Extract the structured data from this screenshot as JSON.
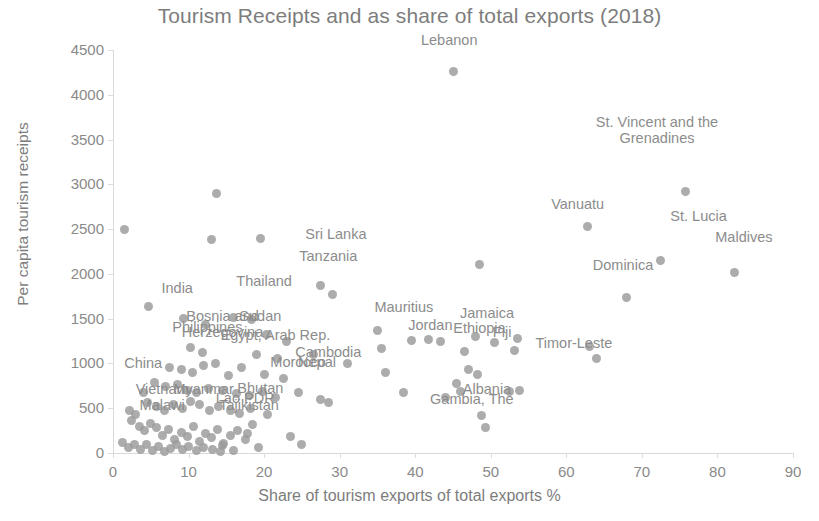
{
  "chart_data": {
    "type": "scatter",
    "title": "Tourism Receipts and as share of total exports (2018)",
    "xlabel": "Share of tourism exports of total exports %",
    "ylabel": "Per capita tourism receipts",
    "xlim": [
      0,
      90
    ],
    "ylim": [
      0,
      4500
    ],
    "xticks": [
      0,
      10,
      20,
      30,
      40,
      50,
      60,
      70,
      80,
      90
    ],
    "yticks": [
      0,
      500,
      1000,
      1500,
      2000,
      2500,
      3000,
      3500,
      4000,
      4500
    ],
    "grid": false,
    "legend": "none",
    "point_color": "#9a9a9a",
    "label_color": "#8c8c8c",
    "annotations": [
      {
        "text": "Lebanon",
        "x": 44.5,
        "y": 4600
      },
      {
        "text": "St. Vincent and the\nGrenadines",
        "x": 72.0,
        "y": 3700
      },
      {
        "text": "Vanuatu",
        "x": 61.5,
        "y": 2770
      },
      {
        "text": "St. Lucia",
        "x": 77.5,
        "y": 2640
      },
      {
        "text": "Maldives",
        "x": 83.5,
        "y": 2400
      },
      {
        "text": "Sri Lanka",
        "x": 29.5,
        "y": 2430
      },
      {
        "text": "Tanzania",
        "x": 28.5,
        "y": 2190
      },
      {
        "text": "Dominica",
        "x": 67.5,
        "y": 2090
      },
      {
        "text": "Thailand",
        "x": 20.0,
        "y": 1910
      },
      {
        "text": "India",
        "x": 8.5,
        "y": 1830
      },
      {
        "text": "Mauritius",
        "x": 38.5,
        "y": 1620
      },
      {
        "text": "Jamaica",
        "x": 49.5,
        "y": 1555
      },
      {
        "text": "Bosnia and\nHerzegovina",
        "x": 14.5,
        "y": 1530
      },
      {
        "text": "Sudan",
        "x": 19.5,
        "y": 1520
      },
      {
        "text": "Jordan",
        "x": 42.0,
        "y": 1420
      },
      {
        "text": "Philippines",
        "x": 12.5,
        "y": 1400
      },
      {
        "text": "Ethiopia",
        "x": 48.5,
        "y": 1380
      },
      {
        "text": "Fiji",
        "x": 51.5,
        "y": 1345
      },
      {
        "text": "Egypt, Arab Rep.",
        "x": 21.5,
        "y": 1310
      },
      {
        "text": "Timor-Leste",
        "x": 61.0,
        "y": 1215
      },
      {
        "text": "Cambodia",
        "x": 28.5,
        "y": 1120
      },
      {
        "text": "Morocco",
        "x": 24.5,
        "y": 1010
      },
      {
        "text": "China",
        "x": 4.0,
        "y": 990
      },
      {
        "text": "Nepal",
        "x": 27.0,
        "y": 1000
      },
      {
        "text": "Bhutan",
        "x": 19.5,
        "y": 710
      },
      {
        "text": "Vietnam",
        "x": 6.5,
        "y": 700
      },
      {
        "text": "Myanmar",
        "x": 12.0,
        "y": 700
      },
      {
        "text": "Albania",
        "x": 49.5,
        "y": 705
      },
      {
        "text": "Lao PDR",
        "x": 17.5,
        "y": 600
      },
      {
        "text": "Malawi",
        "x": 6.5,
        "y": 520
      },
      {
        "text": "Gambia, The",
        "x": 47.5,
        "y": 590
      },
      {
        "text": "Tajikistan",
        "x": 18.0,
        "y": 520
      }
    ],
    "points": [
      {
        "x": 1.5,
        "y": 2500
      },
      {
        "x": 13.7,
        "y": 2900
      },
      {
        "x": 13.0,
        "y": 2380
      },
      {
        "x": 19.5,
        "y": 2390
      },
      {
        "x": 4.7,
        "y": 1640
      },
      {
        "x": 45.0,
        "y": 4265
      },
      {
        "x": 75.8,
        "y": 2920
      },
      {
        "x": 62.8,
        "y": 2525
      },
      {
        "x": 82.3,
        "y": 2020
      },
      {
        "x": 72.5,
        "y": 2150
      },
      {
        "x": 68.0,
        "y": 1740
      },
      {
        "x": 48.5,
        "y": 2100
      },
      {
        "x": 27.5,
        "y": 1870
      },
      {
        "x": 29.0,
        "y": 1770
      },
      {
        "x": 9.3,
        "y": 1500
      },
      {
        "x": 12.3,
        "y": 1430
      },
      {
        "x": 16.0,
        "y": 1510
      },
      {
        "x": 18.3,
        "y": 1490
      },
      {
        "x": 20.3,
        "y": 1320
      },
      {
        "x": 23.0,
        "y": 1250
      },
      {
        "x": 35.0,
        "y": 1370
      },
      {
        "x": 39.5,
        "y": 1260
      },
      {
        "x": 41.8,
        "y": 1265
      },
      {
        "x": 43.3,
        "y": 1250
      },
      {
        "x": 46.5,
        "y": 1130
      },
      {
        "x": 48.0,
        "y": 1300
      },
      {
        "x": 50.5,
        "y": 1230
      },
      {
        "x": 53.5,
        "y": 1280
      },
      {
        "x": 53.2,
        "y": 1150
      },
      {
        "x": 63.0,
        "y": 1185
      },
      {
        "x": 64.0,
        "y": 1055
      },
      {
        "x": 35.5,
        "y": 1170
      },
      {
        "x": 10.2,
        "y": 1180
      },
      {
        "x": 11.8,
        "y": 1120
      },
      {
        "x": 19.0,
        "y": 1100
      },
      {
        "x": 21.8,
        "y": 1060
      },
      {
        "x": 26.5,
        "y": 1095
      },
      {
        "x": 7.5,
        "y": 960
      },
      {
        "x": 9.0,
        "y": 930
      },
      {
        "x": 10.5,
        "y": 900
      },
      {
        "x": 12.0,
        "y": 980
      },
      {
        "x": 13.5,
        "y": 1000
      },
      {
        "x": 15.3,
        "y": 860
      },
      {
        "x": 17.0,
        "y": 950
      },
      {
        "x": 20.0,
        "y": 880
      },
      {
        "x": 22.5,
        "y": 830
      },
      {
        "x": 5.5,
        "y": 790
      },
      {
        "x": 7.0,
        "y": 740
      },
      {
        "x": 8.5,
        "y": 760
      },
      {
        "x": 9.8,
        "y": 700
      },
      {
        "x": 11.0,
        "y": 680
      },
      {
        "x": 12.7,
        "y": 720
      },
      {
        "x": 14.5,
        "y": 700
      },
      {
        "x": 16.3,
        "y": 660
      },
      {
        "x": 18.0,
        "y": 640
      },
      {
        "x": 19.8,
        "y": 690
      },
      {
        "x": 21.5,
        "y": 620
      },
      {
        "x": 24.5,
        "y": 680
      },
      {
        "x": 27.5,
        "y": 600
      },
      {
        "x": 28.5,
        "y": 560
      },
      {
        "x": 38.5,
        "y": 680
      },
      {
        "x": 44.0,
        "y": 620
      },
      {
        "x": 45.5,
        "y": 780
      },
      {
        "x": 46.0,
        "y": 690
      },
      {
        "x": 47.0,
        "y": 930
      },
      {
        "x": 48.2,
        "y": 880
      },
      {
        "x": 48.8,
        "y": 420
      },
      {
        "x": 49.3,
        "y": 290
      },
      {
        "x": 52.5,
        "y": 690
      },
      {
        "x": 53.8,
        "y": 700
      },
      {
        "x": 4.5,
        "y": 560
      },
      {
        "x": 5.8,
        "y": 520
      },
      {
        "x": 6.8,
        "y": 480
      },
      {
        "x": 8.0,
        "y": 540
      },
      {
        "x": 9.2,
        "y": 500
      },
      {
        "x": 10.3,
        "y": 580
      },
      {
        "x": 11.5,
        "y": 540
      },
      {
        "x": 12.8,
        "y": 470
      },
      {
        "x": 14.0,
        "y": 520
      },
      {
        "x": 15.5,
        "y": 480
      },
      {
        "x": 16.8,
        "y": 440
      },
      {
        "x": 18.2,
        "y": 500
      },
      {
        "x": 20.5,
        "y": 430
      },
      {
        "x": 2.5,
        "y": 360
      },
      {
        "x": 3.5,
        "y": 300
      },
      {
        "x": 4.2,
        "y": 250
      },
      {
        "x": 5.0,
        "y": 330
      },
      {
        "x": 5.8,
        "y": 280
      },
      {
        "x": 6.5,
        "y": 200
      },
      {
        "x": 7.3,
        "y": 260
      },
      {
        "x": 8.2,
        "y": 150
      },
      {
        "x": 9.0,
        "y": 230
      },
      {
        "x": 9.8,
        "y": 180
      },
      {
        "x": 10.6,
        "y": 300
      },
      {
        "x": 11.4,
        "y": 130
      },
      {
        "x": 12.2,
        "y": 220
      },
      {
        "x": 13.0,
        "y": 170
      },
      {
        "x": 13.8,
        "y": 260
      },
      {
        "x": 14.6,
        "y": 110
      },
      {
        "x": 15.5,
        "y": 200
      },
      {
        "x": 16.5,
        "y": 250
      },
      {
        "x": 17.5,
        "y": 150
      },
      {
        "x": 18.5,
        "y": 320
      },
      {
        "x": 1.2,
        "y": 120
      },
      {
        "x": 2.0,
        "y": 60
      },
      {
        "x": 2.8,
        "y": 100
      },
      {
        "x": 3.6,
        "y": 40
      },
      {
        "x": 4.4,
        "y": 90
      },
      {
        "x": 5.2,
        "y": 30
      },
      {
        "x": 6.0,
        "y": 70
      },
      {
        "x": 6.8,
        "y": 20
      },
      {
        "x": 7.6,
        "y": 55
      },
      {
        "x": 8.4,
        "y": 95
      },
      {
        "x": 9.2,
        "y": 35
      },
      {
        "x": 10.0,
        "y": 75
      },
      {
        "x": 11.0,
        "y": 25
      },
      {
        "x": 12.0,
        "y": 60
      },
      {
        "x": 13.2,
        "y": 40
      },
      {
        "x": 14.5,
        "y": 80
      },
      {
        "x": 16.0,
        "y": 30
      },
      {
        "x": 17.8,
        "y": 220
      },
      {
        "x": 19.2,
        "y": 60
      },
      {
        "x": 14.2,
        "y": 20
      },
      {
        "x": 23.5,
        "y": 180
      },
      {
        "x": 25.0,
        "y": 90
      },
      {
        "x": 3.0,
        "y": 430
      },
      {
        "x": 2.2,
        "y": 480
      },
      {
        "x": 4.0,
        "y": 680
      },
      {
        "x": 36.0,
        "y": 900
      },
      {
        "x": 31.0,
        "y": 1000
      }
    ]
  }
}
